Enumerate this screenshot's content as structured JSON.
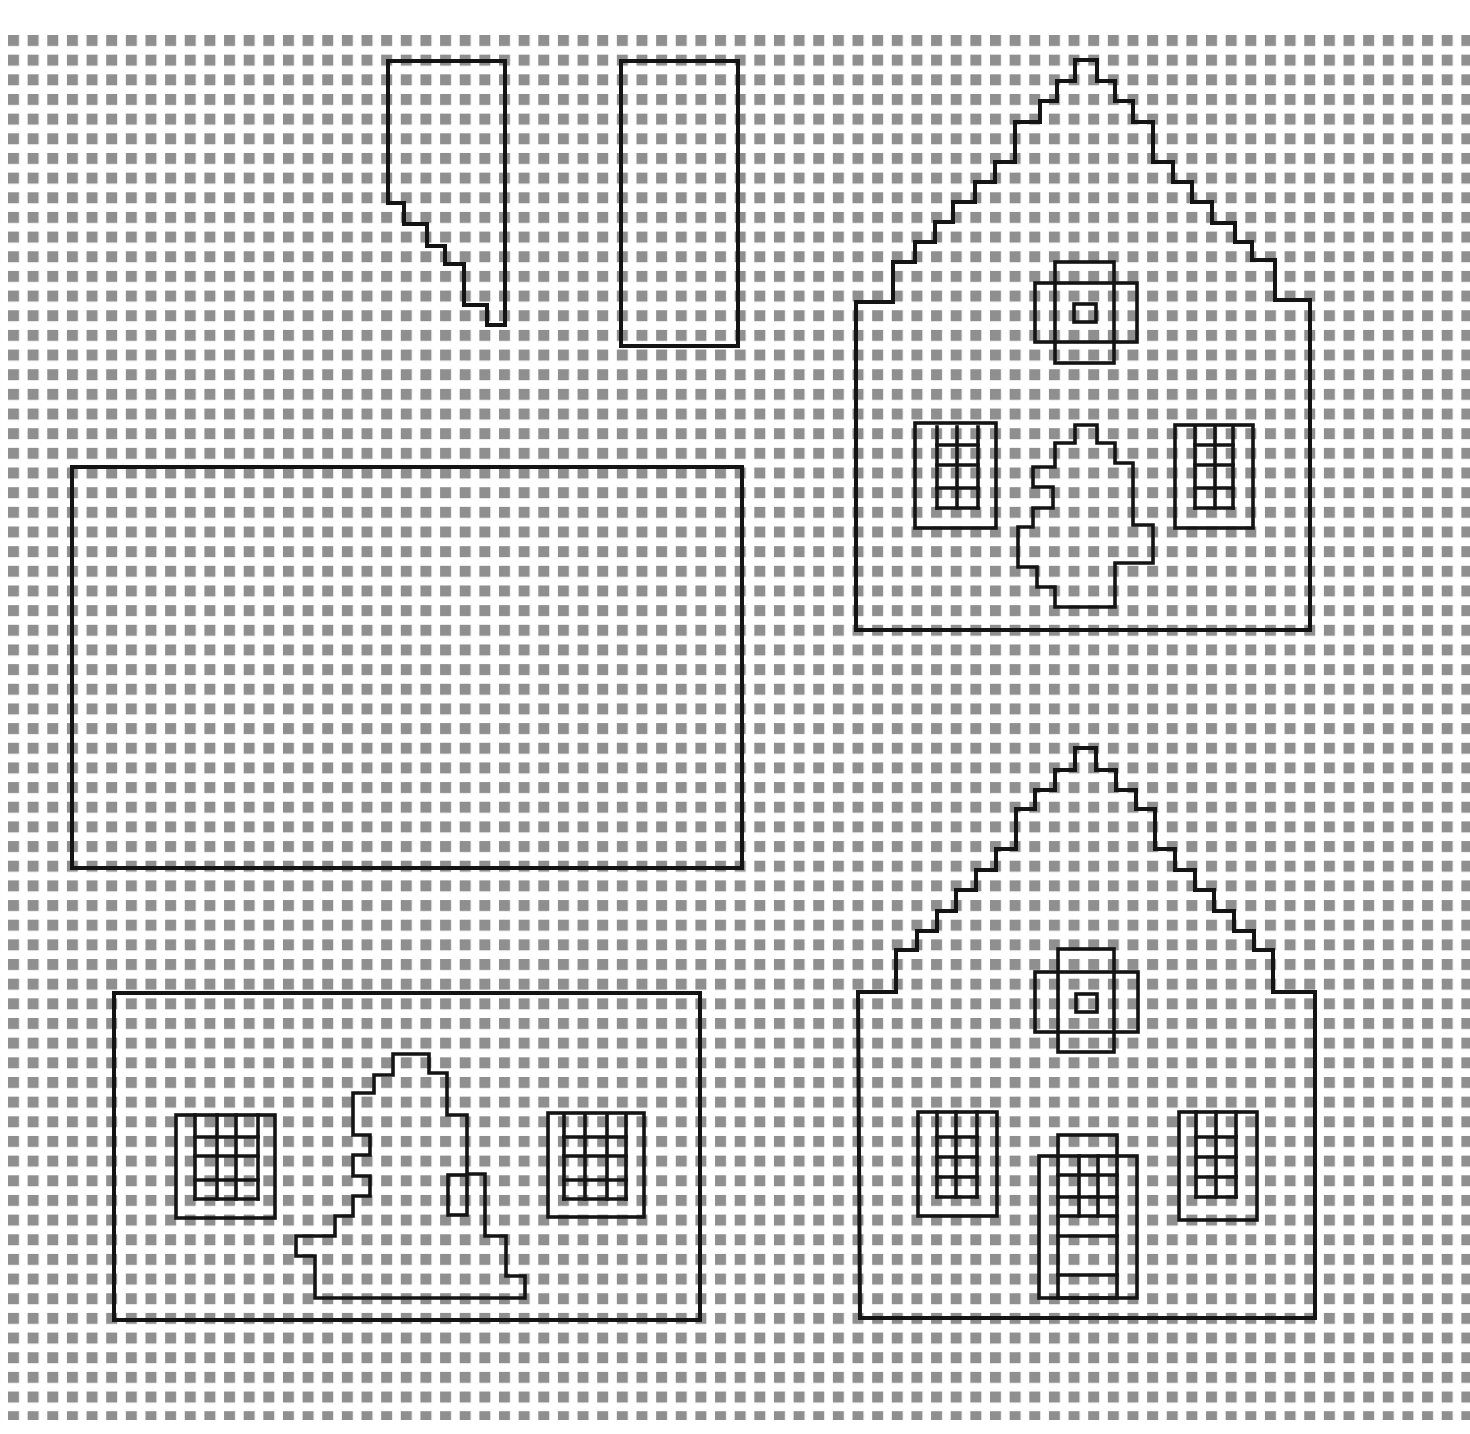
{
  "canvas": {
    "width": 1470,
    "height": 1434,
    "background": "#ffffff"
  },
  "grid": {
    "origin_x": 8,
    "origin_y": 35,
    "pitch_x": 19.64,
    "pitch_y": 19.66,
    "square_size": 11,
    "square_color": "#8f8f8f",
    "clip": {
      "x": 0,
      "y": 33,
      "width": 1470,
      "height": 1387
    }
  },
  "line_color": "#141414",
  "pieces": [
    {
      "id": "roof-side-piece",
      "label": "Stepped side piece",
      "outline": [
        [
          388,
          61
        ],
        [
          505,
          61
        ],
        [
          505,
          325
        ],
        [
          487,
          325
        ],
        [
          487,
          305
        ],
        [
          464,
          305
        ],
        [
          464,
          264
        ],
        [
          445,
          264
        ],
        [
          445,
          246
        ],
        [
          427,
          246
        ],
        [
          427,
          224
        ],
        [
          404,
          224
        ],
        [
          404,
          203
        ],
        [
          388,
          203
        ]
      ],
      "details": []
    },
    {
      "id": "chimney-rectangle",
      "label": "Narrow rectangle",
      "outline": [
        [
          621,
          61
        ],
        [
          738,
          61
        ],
        [
          738,
          346
        ],
        [
          621,
          346
        ]
      ],
      "details": []
    },
    {
      "id": "roof-panel",
      "label": "Large roof rectangle",
      "outline": [
        [
          72,
          467
        ],
        [
          742,
          467
        ],
        [
          742,
          868
        ],
        [
          72,
          868
        ]
      ],
      "details": []
    },
    {
      "id": "gable-back",
      "label": "Back gable wall",
      "outline": [
        [
          1075,
          60
        ],
        [
          1097,
          60
        ],
        [
          1097,
          81
        ],
        [
          1115,
          81
        ],
        [
          1115,
          101
        ],
        [
          1133,
          101
        ],
        [
          1133,
          122
        ],
        [
          1153,
          122
        ],
        [
          1153,
          162
        ],
        [
          1173,
          162
        ],
        [
          1173,
          182
        ],
        [
          1192,
          182
        ],
        [
          1192,
          202
        ],
        [
          1212,
          202
        ],
        [
          1212,
          223
        ],
        [
          1235,
          223
        ],
        [
          1235,
          242
        ],
        [
          1252,
          242
        ],
        [
          1252,
          260
        ],
        [
          1275,
          260
        ],
        [
          1275,
          300
        ],
        [
          1310,
          300
        ],
        [
          1310,
          630
        ],
        [
          856,
          630
        ],
        [
          856,
          302
        ],
        [
          893,
          302
        ],
        [
          893,
          262
        ],
        [
          915,
          262
        ],
        [
          915,
          242
        ],
        [
          935,
          242
        ],
        [
          935,
          222
        ],
        [
          953,
          222
        ],
        [
          953,
          202
        ],
        [
          975,
          202
        ],
        [
          975,
          182
        ],
        [
          995,
          182
        ],
        [
          995,
          162
        ],
        [
          1015,
          162
        ],
        [
          1015,
          122
        ],
        [
          1040,
          122
        ],
        [
          1040,
          101
        ],
        [
          1057,
          101
        ],
        [
          1057,
          81
        ],
        [
          1075,
          81
        ]
      ],
      "details": [
        {
          "type": "rect",
          "name": "attic-window-outer",
          "x": 1035,
          "y": 283,
          "w": 102,
          "h": 59
        },
        {
          "type": "rect",
          "name": "attic-window-tall",
          "x": 1055,
          "y": 262,
          "w": 59,
          "h": 101
        },
        {
          "type": "rect",
          "name": "attic-window-center",
          "x": 1074,
          "y": 304,
          "w": 22,
          "h": 18
        },
        {
          "type": "window",
          "name": "left-window",
          "outer": [
            915,
            423,
            81,
            105
          ],
          "panes": {
            "xs": [
              937,
              957,
              978
            ],
            "ys": [
              427,
              445,
              465,
              488,
              508
            ]
          }
        },
        {
          "type": "window",
          "name": "right-window",
          "outer": [
            1175,
            425,
            78,
            103
          ],
          "panes": {
            "xs": [
              1195,
              1215,
              1233
            ],
            "ys": [
              427,
              445,
              465,
              488,
              508
            ]
          }
        },
        {
          "type": "poly",
          "name": "tree-cutout",
          "points": [
            [
              1075,
              425
            ],
            [
              1097,
              425
            ],
            [
              1097,
              443
            ],
            [
              1115,
              443
            ],
            [
              1115,
              463
            ],
            [
              1133,
              463
            ],
            [
              1133,
              525
            ],
            [
              1153,
              525
            ],
            [
              1153,
              563
            ],
            [
              1115,
              563
            ],
            [
              1115,
              607
            ],
            [
              1055,
              607
            ],
            [
              1055,
              587
            ],
            [
              1037,
              587
            ],
            [
              1037,
              567
            ],
            [
              1018,
              567
            ],
            [
              1018,
              527
            ],
            [
              1033,
              527
            ],
            [
              1033,
              508
            ],
            [
              1053,
              508
            ],
            [
              1053,
              487
            ],
            [
              1033,
              487
            ],
            [
              1033,
              467
            ],
            [
              1055,
              467
            ],
            [
              1055,
              443
            ],
            [
              1075,
              443
            ]
          ]
        }
      ]
    },
    {
      "id": "gable-front",
      "label": "Front gable wall with door",
      "outline": [
        [
          1075,
          748
        ],
        [
          1096,
          748
        ],
        [
          1096,
          770
        ],
        [
          1116,
          770
        ],
        [
          1116,
          790
        ],
        [
          1136,
          790
        ],
        [
          1136,
          809
        ],
        [
          1155,
          809
        ],
        [
          1155,
          849
        ],
        [
          1175,
          849
        ],
        [
          1175,
          870
        ],
        [
          1195,
          870
        ],
        [
          1195,
          890
        ],
        [
          1214,
          890
        ],
        [
          1214,
          911
        ],
        [
          1234,
          911
        ],
        [
          1234,
          931
        ],
        [
          1254,
          931
        ],
        [
          1254,
          950
        ],
        [
          1273,
          950
        ],
        [
          1273,
          992
        ],
        [
          1315,
          992
        ],
        [
          1315,
          1318
        ],
        [
          860,
          1318
        ],
        [
          858,
          992
        ],
        [
          896,
          992
        ],
        [
          896,
          950
        ],
        [
          917,
          950
        ],
        [
          917,
          931
        ],
        [
          937,
          931
        ],
        [
          937,
          911
        ],
        [
          956,
          911
        ],
        [
          956,
          890
        ],
        [
          976,
          890
        ],
        [
          976,
          870
        ],
        [
          996,
          870
        ],
        [
          996,
          849
        ],
        [
          1016,
          849
        ],
        [
          1016,
          809
        ],
        [
          1035,
          809
        ],
        [
          1035,
          790
        ],
        [
          1055,
          790
        ],
        [
          1055,
          770
        ],
        [
          1075,
          770
        ]
      ],
      "details": [
        {
          "type": "rect",
          "name": "attic-window-outer",
          "x": 1035,
          "y": 972,
          "w": 103,
          "h": 60
        },
        {
          "type": "rect",
          "name": "attic-window-tall",
          "x": 1058,
          "y": 949,
          "w": 56,
          "h": 103
        },
        {
          "type": "rect",
          "name": "attic-window-center",
          "x": 1076,
          "y": 994,
          "w": 21,
          "h": 18
        },
        {
          "type": "window",
          "name": "left-window",
          "outer": [
            918,
            1112,
            79,
            104
          ],
          "panes": {
            "xs": [
              937,
              956,
              977
            ],
            "ys": [
              1112,
              1137,
              1157,
              1177,
              1197
            ]
          }
        },
        {
          "type": "window",
          "name": "right-window",
          "outer": [
            1179,
            1112,
            78,
            108
          ],
          "panes": {
            "xs": [
              1196,
              1216,
              1236
            ],
            "ys": [
              1112,
              1137,
              1157,
              1177,
              1197
            ]
          }
        },
        {
          "type": "rect",
          "name": "door-frame",
          "x": 1039,
          "y": 1156,
          "w": 98,
          "h": 142
        },
        {
          "type": "rect",
          "name": "door",
          "x": 1058,
          "y": 1135,
          "w": 59,
          "h": 163
        },
        {
          "type": "lines",
          "name": "door-panels",
          "segments": [
            [
              1058,
              1175,
              1117,
              1175
            ],
            [
              1058,
              1197,
              1117,
              1197
            ],
            [
              1058,
              1216,
              1117,
              1216
            ],
            [
              1058,
              1236,
              1117,
              1236
            ],
            [
              1058,
              1275,
              1117,
              1275
            ],
            [
              1079,
              1156,
              1079,
              1216
            ],
            [
              1098,
              1156,
              1098,
              1216
            ]
          ]
        }
      ]
    },
    {
      "id": "side-wall",
      "label": "Side wall with tree",
      "outline": [
        [
          114,
          993
        ],
        [
          700,
          993
        ],
        [
          700,
          1320
        ],
        [
          114,
          1320
        ]
      ],
      "details": [
        {
          "type": "window",
          "name": "left-window",
          "outer": [
            176,
            1115,
            99,
            103
          ],
          "panes": {
            "xs": [
              195,
              217,
              236,
              258
            ],
            "ys": [
              1115,
              1137,
              1156,
              1180,
              1199
            ]
          }
        },
        {
          "type": "window",
          "name": "right-window",
          "outer": [
            548,
            1113,
            96,
            104
          ],
          "panes": {
            "xs": [
              564,
              585,
              607,
              626
            ],
            "ys": [
              1115,
              1137,
              1156,
              1180,
              1199
            ]
          }
        },
        {
          "type": "poly",
          "name": "tree-cutout",
          "points": [
            [
              393,
              1054
            ],
            [
              429,
              1054
            ],
            [
              429,
              1073
            ],
            [
              447,
              1073
            ],
            [
              447,
              1115
            ],
            [
              467,
              1115
            ],
            [
              467,
              1174
            ],
            [
              485,
              1174
            ],
            [
              485,
              1236
            ],
            [
              506,
              1236
            ],
            [
              506,
              1276
            ],
            [
              525,
              1276
            ],
            [
              525,
              1298
            ],
            [
              315,
              1298
            ],
            [
              315,
              1256
            ],
            [
              296,
              1256
            ],
            [
              296,
              1236
            ],
            [
              335,
              1236
            ],
            [
              335,
              1216
            ],
            [
              353,
              1216
            ],
            [
              353,
              1196
            ],
            [
              370,
              1196
            ],
            [
              370,
              1176
            ],
            [
              353,
              1176
            ],
            [
              353,
              1155
            ],
            [
              370,
              1155
            ],
            [
              370,
              1135
            ],
            [
              353,
              1135
            ],
            [
              353,
              1093
            ],
            [
              374,
              1093
            ],
            [
              374,
              1075
            ],
            [
              393,
              1075
            ]
          ]
        },
        {
          "type": "rect",
          "name": "small-opening",
          "x": 448,
          "y": 1175,
          "w": 19,
          "h": 40
        }
      ]
    }
  ]
}
